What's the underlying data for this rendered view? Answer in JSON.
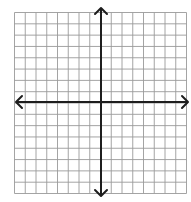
{
  "diagram": {
    "type": "coordinate-grid",
    "title": "",
    "grid": {
      "columns": 16,
      "rows": 16,
      "left": 14.5,
      "top": 12.5,
      "right": 186.5,
      "bottom": 193.5,
      "line_color": "#9a9a9a",
      "line_width": 0.9
    },
    "axes": {
      "x_axis": {
        "y": 102,
        "x_start": 16,
        "x_end": 188,
        "arrows": "both",
        "label": ""
      },
      "y_axis": {
        "x": 101,
        "y_start": 8,
        "y_end": 196,
        "arrows": "both",
        "label": ""
      },
      "color": "#1e1e1e",
      "line_width": 2
    },
    "tick_labels": []
  },
  "colors": {
    "background": "#ffffff",
    "grid_line": "#9a9a9a",
    "axis": "#1e1e1e"
  }
}
